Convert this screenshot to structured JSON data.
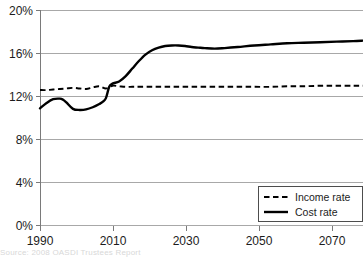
{
  "chart_data": {
    "type": "line",
    "title": "",
    "subtitle": "",
    "xlabel": "",
    "ylabel": "",
    "xlim": [
      1990,
      2088
    ],
    "ylim": [
      0,
      20
    ],
    "grid": true,
    "grid_axis": "y",
    "legend_position": "bottom-right",
    "yticks": [
      0,
      4,
      8,
      12,
      16,
      20
    ],
    "ytick_labels": [
      "0%",
      "4%",
      "8%",
      "12%",
      "16%",
      "20%"
    ],
    "xticks": [
      1990,
      2010,
      2030,
      2050,
      2070
    ],
    "xtick_labels": [
      "1990",
      "2010",
      "2030",
      "2050",
      "2070"
    ],
    "series": [
      {
        "name": "Income rate",
        "style": "dashed",
        "color": "#000000",
        "x": [
          1990,
          1992,
          1994,
          1996,
          1998,
          2000,
          2002,
          2004,
          2006,
          2008,
          2010,
          2012,
          2014,
          2016,
          2018,
          2020,
          2025,
          2030,
          2035,
          2040,
          2045,
          2050,
          2055,
          2060,
          2065,
          2070,
          2075,
          2080,
          2085,
          2088
        ],
        "values": [
          12.6,
          12.6,
          12.65,
          12.7,
          12.75,
          12.8,
          12.75,
          12.7,
          12.85,
          12.95,
          12.75,
          13.0,
          12.95,
          12.9,
          12.9,
          12.9,
          12.9,
          12.9,
          12.9,
          12.9,
          12.9,
          12.9,
          12.9,
          12.9,
          12.95,
          12.95,
          13.0,
          13.0,
          13.0,
          13.0
        ]
      },
      {
        "name": "Cost rate",
        "style": "solid",
        "color": "#000000",
        "x": [
          1990,
          1992,
          1994,
          1996,
          1997,
          1998,
          2000,
          2002,
          2004,
          2006,
          2008,
          2009,
          2010,
          2011,
          2012,
          2014,
          2016,
          2018,
          2020,
          2022,
          2024,
          2026,
          2028,
          2030,
          2032,
          2034,
          2036,
          2038,
          2040,
          2043,
          2046,
          2050,
          2055,
          2060,
          2065,
          2070,
          2075,
          2080,
          2085,
          2088
        ],
        "values": [
          10.9,
          11.4,
          11.75,
          11.8,
          11.7,
          11.45,
          10.85,
          10.75,
          10.8,
          11.0,
          11.3,
          11.5,
          11.85,
          12.9,
          13.2,
          13.4,
          13.9,
          14.6,
          15.3,
          15.9,
          16.3,
          16.55,
          16.7,
          16.75,
          16.75,
          16.7,
          16.6,
          16.55,
          16.5,
          16.45,
          16.5,
          16.6,
          16.75,
          16.85,
          16.95,
          17.0,
          17.05,
          17.1,
          17.15,
          17.2
        ]
      }
    ],
    "annotations": []
  },
  "legend": {
    "items": [
      {
        "label": "Income rate",
        "swatch": "dashed-line-swatch"
      },
      {
        "label": "Cost rate",
        "swatch": "solid-line-swatch"
      }
    ]
  },
  "axes": {
    "y": {
      "labels": [
        "20%",
        "16%",
        "12%",
        "8%",
        "4%",
        "0%"
      ]
    },
    "x": {
      "labels": [
        "1990",
        "2010",
        "2030",
        "2050",
        "2070"
      ]
    }
  },
  "caption": {
    "text": "Source:  2008 OASDI Trustees Report"
  },
  "colors": {
    "line": "#000000",
    "grid": "#a8a8a8",
    "axis": "#7a7a7a",
    "text": "#1c1c1c",
    "background": "#ffffff"
  }
}
